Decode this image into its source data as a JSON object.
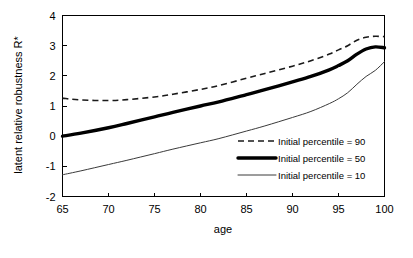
{
  "chart_data": {
    "type": "line",
    "title": "",
    "xlabel": "age",
    "ylabel": "latent relative robustness R*",
    "xlim": [
      65,
      100
    ],
    "ylim": [
      -2,
      4
    ],
    "xticks": [
      "65",
      "70",
      "75",
      "80",
      "85",
      "90",
      "95",
      "100"
    ],
    "yticks": [
      "4",
      "3",
      "2",
      "1",
      "0",
      "-1",
      "-2"
    ],
    "grid": false,
    "legend_position": "center-right-inside",
    "x": [
      65,
      67,
      70,
      72,
      75,
      77,
      80,
      82,
      85,
      87,
      90,
      92,
      94,
      95,
      96,
      97,
      98,
      99,
      100
    ],
    "series": [
      {
        "name": "Initial percentile = 90",
        "style": "dashed",
        "values": [
          1.26,
          1.2,
          1.18,
          1.21,
          1.3,
          1.39,
          1.55,
          1.68,
          1.92,
          2.08,
          2.32,
          2.5,
          2.72,
          2.86,
          3.0,
          3.18,
          3.28,
          3.31,
          3.3
        ]
      },
      {
        "name": "Initial percentile = 50",
        "style": "thick-solid",
        "values": [
          0.0,
          0.1,
          0.28,
          0.42,
          0.64,
          0.79,
          1.0,
          1.14,
          1.38,
          1.54,
          1.8,
          1.98,
          2.2,
          2.34,
          2.5,
          2.72,
          2.89,
          2.96,
          2.93
        ]
      },
      {
        "name": "Initial percentile = 10",
        "style": "thin-solid",
        "values": [
          -1.28,
          -1.15,
          -0.94,
          -0.8,
          -0.58,
          -0.43,
          -0.22,
          -0.08,
          0.17,
          0.34,
          0.62,
          0.82,
          1.08,
          1.24,
          1.44,
          1.72,
          1.98,
          2.18,
          2.47
        ]
      }
    ],
    "legend": [
      {
        "label": "Initial percentile = 90",
        "style": "dashed"
      },
      {
        "label": "Initial percentile = 50",
        "style": "thick-solid"
      },
      {
        "label": "Initial percentile = 10",
        "style": "thin-solid"
      }
    ]
  }
}
